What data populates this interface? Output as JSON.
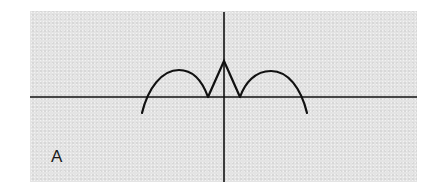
{
  "figure": {
    "panel_label": "A",
    "background_color": "#e4e4e4",
    "line_color": "#111111"
  },
  "diagram": {
    "type": "function-sketch",
    "axes": {
      "horizontal": {
        "x1": 30,
        "y1": 97,
        "x2": 417,
        "y2": 97
      },
      "vertical": {
        "x1": 224,
        "y1": 12,
        "x2": 224,
        "y2": 182
      }
    },
    "curve": {
      "description": "Two downward arcs on either side of the origin connected by a central triangular spike",
      "left_arc": {
        "start": [
          142,
          113
        ],
        "axis_crossing": [
          147,
          97
        ],
        "peak": [
          179,
          70
        ],
        "end_cusp": [
          208,
          97
        ]
      },
      "central_spike": {
        "left_cusp": [
          208,
          97
        ],
        "apex": [
          224,
          61
        ],
        "right_cusp": [
          240,
          97
        ]
      },
      "right_arc": {
        "start_cusp": [
          240,
          97
        ],
        "peak": [
          271,
          71
        ],
        "axis_crossing": [
          301,
          97
        ],
        "end": [
          307,
          113
        ]
      }
    }
  }
}
